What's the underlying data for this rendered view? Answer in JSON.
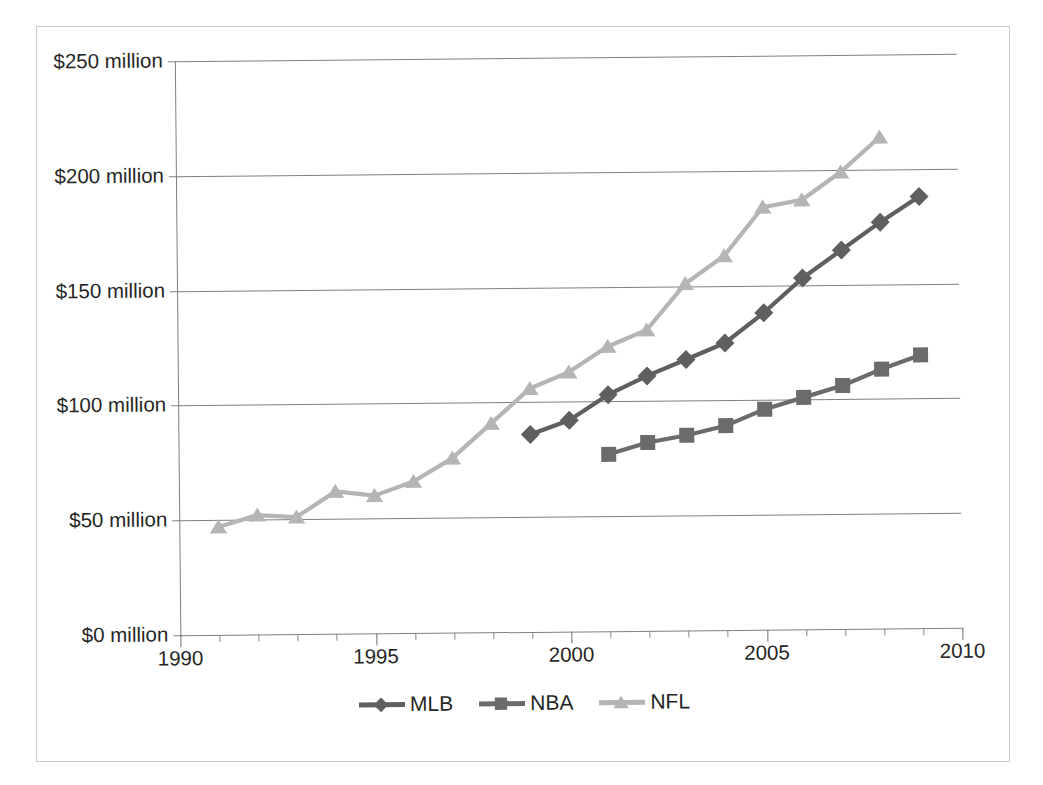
{
  "chart_data": {
    "type": "line",
    "title": "",
    "subtitle": "",
    "xlabel": "",
    "ylabel": "",
    "xlim": [
      1990,
      2010
    ],
    "ylim": [
      0,
      250
    ],
    "grid": "horizontal",
    "legend_position": "bottom-center",
    "y_ticks": [
      0,
      50,
      100,
      150,
      200,
      250
    ],
    "y_tick_labels": [
      "$0 million",
      "$50 million",
      "$100 million",
      "$150 million",
      "$200 million",
      "$250 million"
    ],
    "x_ticks": [
      1990,
      1995,
      2000,
      2005,
      2010
    ],
    "x_tick_labels": [
      "1990",
      "1995",
      "2000",
      "2005",
      "2010"
    ],
    "x_minor_tick_step": 1,
    "units": "millions of US dollars",
    "series": [
      {
        "name": "MLB",
        "color": "#5f5f5f",
        "marker": "diamond",
        "x": [
          1999,
          2000,
          2001,
          2002,
          2003,
          2004,
          2005,
          2006,
          2007,
          2008,
          2009
        ],
        "values": [
          86,
          92,
          103,
          111,
          118,
          125,
          138,
          153,
          165,
          177,
          188
        ]
      },
      {
        "name": "NBA",
        "color": "#6b6b6b",
        "marker": "square",
        "x": [
          2001,
          2002,
          2003,
          2004,
          2005,
          2006,
          2007,
          2008,
          2009
        ],
        "values": [
          77,
          82,
          85,
          89,
          96,
          101,
          106,
          113,
          119
        ]
      },
      {
        "name": "NFL",
        "color": "#b5b5b5",
        "marker": "triangle",
        "x": [
          1991,
          1992,
          1993,
          1994,
          1995,
          1996,
          1997,
          1998,
          1999,
          2000,
          2001,
          2002,
          2003,
          2004,
          2005,
          2006,
          2007,
          2008
        ],
        "values": [
          47,
          52,
          51,
          62,
          60,
          66,
          76,
          91,
          106,
          113,
          124,
          131,
          151,
          163,
          184,
          187,
          199,
          214
        ]
      }
    ]
  },
  "legend": {
    "items": [
      {
        "label": "MLB"
      },
      {
        "label": "NBA"
      },
      {
        "label": "NFL"
      }
    ]
  },
  "colors": {
    "mlb": "#5f5f5f",
    "nba": "#6b6b6b",
    "nfl": "#b5b5b5",
    "axis": "#808080",
    "grid": "#808080",
    "text": "#262626",
    "frame": "#c9c9c9",
    "background": "#ffffff"
  }
}
